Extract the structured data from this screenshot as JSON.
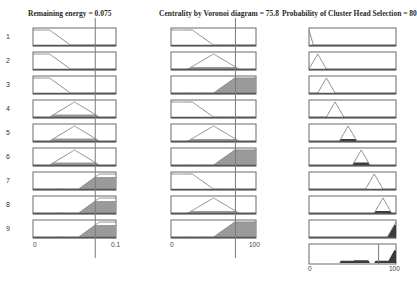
{
  "window": {
    "type": "fuzzy-rule-viewer"
  },
  "inputs": [
    {
      "name": "Remaining energy",
      "title": "Remaining energy = 0.075",
      "value": 0.075,
      "range": [
        0,
        0.1
      ],
      "ticks": [
        "0",
        "0.1"
      ],
      "mfs": {
        "low": {
          "type": "zmf",
          "params": [
            0.02,
            0.045
          ]
        },
        "medium": {
          "type": "trimf",
          "params": [
            0.02,
            0.05,
            0.08
          ]
        },
        "high": {
          "type": "smf",
          "params": [
            0.055,
            0.08
          ]
        }
      }
    },
    {
      "name": "Centrality by Voronoi diagram",
      "title": "Centrality by Voronoi diagram = 75.8",
      "value": 75.8,
      "range": [
        0,
        100
      ],
      "ticks": [
        "0",
        "100"
      ],
      "mfs": {
        "low": {
          "type": "zmf",
          "params": [
            25,
            50
          ]
        },
        "medium": {
          "type": "trimf",
          "params": [
            20,
            50,
            80
          ]
        },
        "high": {
          "type": "smf",
          "params": [
            50,
            75
          ]
        }
      }
    }
  ],
  "output": {
    "name": "Probability of Cluster Head Selection",
    "title": "Probability of Cluster Head Selection = 80",
    "value": 80,
    "range": [
      0,
      100
    ],
    "ticks": [
      "0",
      "100"
    ],
    "mfs": [
      {
        "type": "zmf",
        "params": [
          0,
          5
        ]
      },
      {
        "type": "trimf",
        "params": [
          0,
          10,
          20
        ]
      },
      {
        "type": "trimf",
        "params": [
          10,
          20,
          30
        ]
      },
      {
        "type": "trimf",
        "params": [
          20,
          30,
          40
        ]
      },
      {
        "type": "trimf",
        "params": [
          35,
          45,
          55
        ]
      },
      {
        "type": "trimf",
        "params": [
          50,
          60,
          70
        ]
      },
      {
        "type": "trimf",
        "params": [
          65,
          75,
          85
        ]
      },
      {
        "type": "trimf",
        "params": [
          75,
          85,
          95
        ]
      },
      {
        "type": "smf",
        "params": [
          90,
          100
        ]
      }
    ]
  },
  "rules": [
    {
      "num": "1",
      "in1": "low",
      "in2": "low",
      "out": 0
    },
    {
      "num": "2",
      "in1": "low",
      "in2": "medium",
      "out": 1
    },
    {
      "num": "3",
      "in1": "low",
      "in2": "high",
      "out": 2
    },
    {
      "num": "4",
      "in1": "medium",
      "in2": "low",
      "out": 3
    },
    {
      "num": "5",
      "in1": "medium",
      "in2": "medium",
      "out": 4
    },
    {
      "num": "6",
      "in1": "medium",
      "in2": "high",
      "out": 5
    },
    {
      "num": "7",
      "in1": "high",
      "in2": "low",
      "out": 6
    },
    {
      "num": "8",
      "in1": "high",
      "in2": "medium",
      "out": 7
    },
    {
      "num": "9",
      "in1": "high",
      "in2": "high",
      "out": 8
    }
  ],
  "colors": {
    "frame": "#6b6b6b",
    "mf_line": "#8a8a8a",
    "fill_input": "#9a9a9a",
    "fill_output": "#3a3a3a",
    "index_line": "#7a7a7a"
  }
}
